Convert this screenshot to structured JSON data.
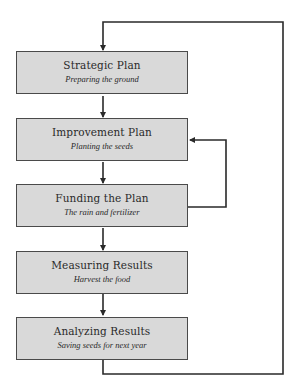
{
  "diagram": {
    "type": "flowchart",
    "colors": {
      "box_fill": "#d9d9d9",
      "box_border": "#4a4a4a",
      "line": "#2a2a2a",
      "text": "#2a2a2a"
    },
    "steps": [
      {
        "title": "Strategic Plan",
        "subtitle": "Preparing the ground"
      },
      {
        "title": "Improvement Plan",
        "subtitle": "Planting the seeds"
      },
      {
        "title": "Funding the Plan",
        "subtitle": "The rain and fertilizer"
      },
      {
        "title": "Measuring Results",
        "subtitle": "Harvest the food"
      },
      {
        "title": "Analyzing Results",
        "subtitle": "Saving seeds for next year"
      }
    ],
    "connections": [
      {
        "from": "Strategic Plan",
        "to": "Improvement Plan",
        "type": "arrow"
      },
      {
        "from": "Improvement Plan",
        "to": "Funding the Plan",
        "type": "arrow"
      },
      {
        "from": "Funding the Plan",
        "to": "Measuring Results",
        "type": "arrow"
      },
      {
        "from": "Measuring Results",
        "to": "Analyzing Results",
        "type": "arrow"
      },
      {
        "from": "Funding the Plan",
        "to": "Improvement Plan",
        "type": "feedback-loop"
      },
      {
        "from": "Analyzing Results",
        "to": "Strategic Plan",
        "type": "feedback-loop"
      }
    ]
  }
}
